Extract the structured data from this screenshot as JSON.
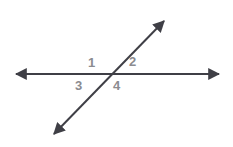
{
  "figure": {
    "background_color": "#ffffff",
    "line_color": "#3f3f46",
    "label_color": "#8b8b8f",
    "labels": [
      {
        "id": "label-1",
        "text": "1",
        "position": "above-left-of-intersection"
      },
      {
        "id": "label-2",
        "text": "2",
        "position": "above-right-of-intersection"
      },
      {
        "id": "label-3",
        "text": "3",
        "position": "below-left-of-intersection"
      },
      {
        "id": "label-4",
        "text": "4",
        "position": "below-right-of-intersection"
      }
    ],
    "lines": [
      {
        "name": "horizontal-line",
        "x1": 10,
        "y1": 74,
        "x2": 225,
        "y2": 74,
        "arrowheads": "both"
      },
      {
        "name": "diagonal-line",
        "x1": 48,
        "y1": 140,
        "x2": 170,
        "y2": 15,
        "arrowheads": "both"
      }
    ],
    "intersection": {
      "x": 112,
      "y": 74
    }
  }
}
